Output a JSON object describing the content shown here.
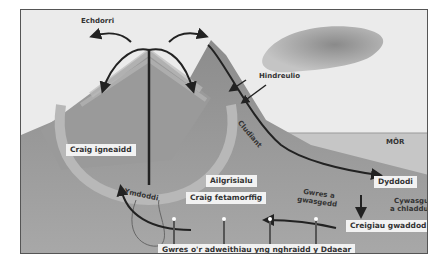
{
  "diagram": {
    "labels": {
      "erosion": "Echdorri",
      "weathering": "Hindreulio",
      "transport": "Cludiant",
      "sea": "MÔR",
      "deposition": "Dyddodi",
      "compaction_line1": "Cywasgu",
      "compaction_line2": "a chladdu",
      "sedimentary": "Creigiau gwaddod",
      "heat_pressure_line1": "Gwres a",
      "heat_pressure_line2": "gwasgedd",
      "metamorphic": "Craig fetamorffig",
      "recrystallisation": "Ailgrisialu",
      "melting": "Ymdoddi",
      "igneous": "Craig igneaidd",
      "earth_heat": "Gwres o'r adweithiau yng nghraidd y Ddaear"
    },
    "colors": {
      "sky": "#e9e9e9",
      "sea": "#c8c8c8",
      "ground": "#8a8a8a",
      "mountain": "#7a7a7a",
      "arrow": "#222222",
      "label_bg": "#f2f2f2"
    }
  }
}
